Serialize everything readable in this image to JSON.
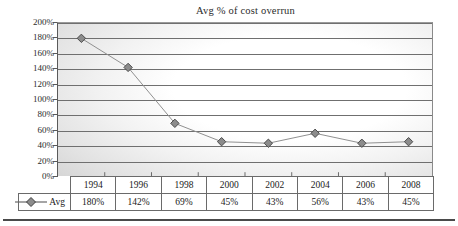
{
  "chart_data": {
    "type": "line",
    "title": "Avg % of cost overrun",
    "xlabel": "",
    "ylabel": "",
    "categories": [
      "1994",
      "1996",
      "1998",
      "2000",
      "2002",
      "2004",
      "2006",
      "2008"
    ],
    "series": [
      {
        "name": "Avg",
        "values": [
          180,
          142,
          69,
          45,
          43,
          56,
          43,
          45
        ],
        "value_labels": [
          "180%",
          "142%",
          "69%",
          "45%",
          "43%",
          "56%",
          "43%",
          "45%"
        ],
        "marker": "diamond",
        "marker_color": "#8c8c8c",
        "marker_border_color": "#4a4a4a",
        "line_color": "#8f8f8f"
      }
    ],
    "ylim": [
      0,
      200
    ],
    "ytick_values": [
      0,
      20,
      40,
      60,
      80,
      100,
      120,
      140,
      160,
      180,
      200
    ],
    "ytick_labels": [
      "0%",
      "20%",
      "40%",
      "60%",
      "80%",
      "100%",
      "120%",
      "140%",
      "160%",
      "180%",
      "200%"
    ],
    "grid": true,
    "grid_axis": "y",
    "legend": {
      "position": "data-table",
      "entries": [
        "Avg"
      ]
    },
    "data_table": {
      "visible": true,
      "row_label_header": "",
      "column_headers": [
        "1994",
        "1996",
        "1998",
        "2000",
        "2002",
        "2004",
        "2006",
        "2008"
      ],
      "rows": [
        {
          "label": "Avg",
          "cells": [
            "180%",
            "142%",
            "69%",
            "45%",
            "43%",
            "56%",
            "43%",
            "45%"
          ]
        }
      ]
    },
    "plot_background": {
      "style": "radial-gradient",
      "center_color": "#ffffff",
      "edge_color": "#b2b2b2"
    }
  },
  "colors": {
    "gridline": "#6f6f6f",
    "axis": "#5a5a5a",
    "text": "#222222",
    "table_border": "#6a6a6a",
    "marker_fill": "#8c8c8c",
    "marker_stroke": "#4a4a4a",
    "line": "#8f8f8f"
  }
}
